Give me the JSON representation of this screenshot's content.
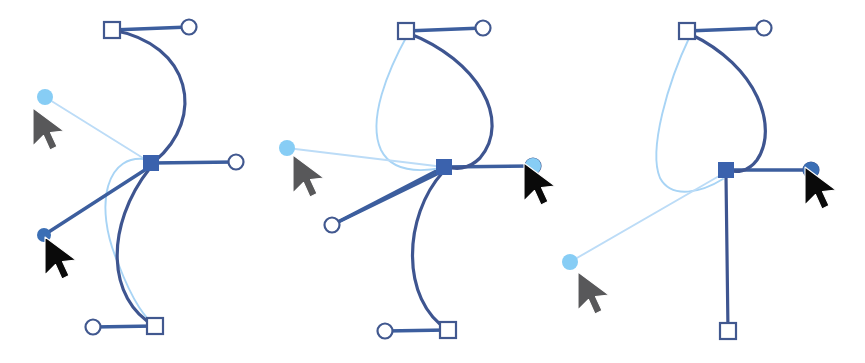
{
  "canvas": {
    "width": 865,
    "height": 363,
    "background": "#ffffff",
    "title": "Bezier path anchor-handle editing sequence"
  },
  "palette": {
    "dark_blue": "#41588f",
    "curve_blue": "#3e5590",
    "handle_blue": "#3c5e9e",
    "node_fill": "#3b62ad",
    "light_blue": "#a8d4f5",
    "light_blue_line": "#bcdcf7",
    "dot_light": "#87cdf5",
    "dot_dark": "#3b6fb5",
    "cursor_gray": "#58585a",
    "cursor_black": "#0a0a0a",
    "white": "#ffffff"
  },
  "stroke_widths": {
    "curve": 3.2,
    "handle_line": 3.4,
    "preview_curve": 1.9,
    "preview_line": 1.9,
    "marker_outline": 2.2
  },
  "panels": [
    {
      "name": "panel-1",
      "label": "State 1",
      "anchor": {
        "x": 151,
        "y": 163,
        "size": 15,
        "shape": "square-filled"
      },
      "handles": [
        {
          "name": "top-handle",
          "square": {
            "x": 112,
            "y": 30
          },
          "circle": {
            "x": 189,
            "y": 27
          }
        },
        {
          "name": "right-handle",
          "circle": {
            "x": 236,
            "y": 162
          }
        },
        {
          "name": "bottom-handle",
          "square": {
            "x": 155,
            "y": 326
          },
          "circle": {
            "x": 93,
            "y": 327
          }
        }
      ],
      "cursors": [
        {
          "name": "drag-cursor-light",
          "color": "cursor_gray",
          "x": 33,
          "y": 108,
          "dot": {
            "x": 45,
            "y": 97,
            "r": 8,
            "color": "dot_light"
          }
        },
        {
          "name": "drag-cursor-dark",
          "color": "cursor_black",
          "x": 45,
          "y": 237,
          "dot": {
            "x": 44,
            "y": 235,
            "r": 7,
            "color": "dot_dark"
          }
        }
      ],
      "curves": [
        {
          "name": "upper-curve",
          "style": "curve",
          "d": "M 112 30 C 192 44 206 118 155 161"
        },
        {
          "name": "lower-curve",
          "style": "curve",
          "d": "M 150 168 C 104 226 107 300 155 326"
        },
        {
          "name": "preview-upper-arc",
          "style": "preview_curve",
          "d": "M 150 160 C 106 150 93 205 118 263"
        },
        {
          "name": "preview-lower-arc",
          "style": "preview_curve",
          "d": "M 118 263 C 134 305 146 318 155 326"
        },
        {
          "name": "preview-drag-line",
          "style": "preview_line",
          "d": "M 45 97 L 151 163"
        },
        {
          "name": "handle-line-down-left",
          "style": "handle_line",
          "d": "M 151 166 L 44 235"
        }
      ]
    },
    {
      "name": "panel-2",
      "label": "State 2",
      "anchor": {
        "x": 444,
        "y": 167,
        "size": 15,
        "shape": "square-filled"
      },
      "handles": [
        {
          "name": "top-handle",
          "square": {
            "x": 406,
            "y": 31
          },
          "circle": {
            "x": 483,
            "y": 28
          }
        },
        {
          "name": "right-handle",
          "circle": {
            "x": 533,
            "y": 166
          }
        },
        {
          "name": "bottom-handle",
          "square": {
            "x": 448,
            "y": 330
          },
          "circle": {
            "x": 385,
            "y": 331
          }
        },
        {
          "name": "lower-left-handle",
          "circle": {
            "x": 332,
            "y": 225
          }
        }
      ],
      "cursors": [
        {
          "name": "drag-cursor-light",
          "color": "cursor_gray",
          "x": 293,
          "y": 155,
          "dot": {
            "x": 287,
            "y": 148,
            "r": 8,
            "color": "dot_light"
          }
        },
        {
          "name": "drag-cursor-dark",
          "color": "cursor_black",
          "x": 524,
          "y": 163,
          "dot": {
            "x": 533,
            "y": 166,
            "r": 8,
            "color": "dot_light"
          }
        }
      ],
      "curves": [
        {
          "name": "upper-loop-right",
          "style": "curve",
          "d": "M 408 33 C 478 60 512 120 480 158 C 468 170 455 170 446 166"
        },
        {
          "name": "lower-curve",
          "style": "curve",
          "d": "M 443 172 C 403 216 400 300 448 330"
        },
        {
          "name": "preview-loop-left",
          "style": "preview_curve",
          "d": "M 408 34 C 388 70 367 120 381 150 C 392 172 420 172 442 168"
        },
        {
          "name": "preview-drag-line",
          "style": "preview_line",
          "d": "M 287 148 L 444 167"
        },
        {
          "name": "handle-line-lower-left",
          "style": "handle_line",
          "d": "M 443 171 L 332 225"
        }
      ]
    },
    {
      "name": "panel-3",
      "label": "State 3",
      "anchor": {
        "x": 726,
        "y": 170,
        "size": 15,
        "shape": "square-filled"
      },
      "handles": [
        {
          "name": "top-handle",
          "square": {
            "x": 687,
            "y": 31
          },
          "circle": {
            "x": 764,
            "y": 28
          }
        },
        {
          "name": "right-handle",
          "circle": {
            "x": 811,
            "y": 170
          }
        },
        {
          "name": "bottom-handle",
          "square": {
            "x": 728,
            "y": 331
          }
        }
      ],
      "cursors": [
        {
          "name": "drag-cursor-light",
          "color": "cursor_gray",
          "x": 578,
          "y": 272,
          "dot": {
            "x": 570,
            "y": 262,
            "r": 8,
            "color": "dot_light"
          }
        },
        {
          "name": "drag-cursor-dark",
          "color": "cursor_black",
          "x": 805,
          "y": 167,
          "dot": {
            "x": 811,
            "y": 170,
            "r": 8,
            "color": "dot_dark"
          }
        }
      ],
      "curves": [
        {
          "name": "upper-loop-right",
          "style": "curve",
          "d": "M 690 34 C 758 66 779 128 757 160 C 748 172 736 173 729 170"
        },
        {
          "name": "lower-vertical",
          "style": "curve",
          "d": "M 726 176 L 728 331"
        },
        {
          "name": "preview-loop-left",
          "style": "preview_curve",
          "d": "M 690 36 C 668 82 648 150 660 178 C 672 200 702 192 723 179"
        },
        {
          "name": "preview-drag-line",
          "style": "preview_line",
          "d": "M 570 262 L 726 172"
        }
      ]
    }
  ]
}
